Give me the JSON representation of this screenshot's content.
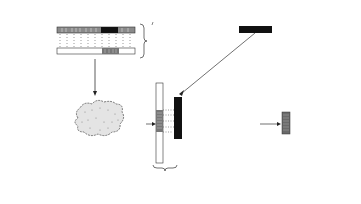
{
  "title_tumor": "Adenovirus type 12 tumor",
  "title_viral_dna": "Adenovirus type 12 DNA",
  "labels": {
    "dna": "DNA",
    "labeled_mrna": "Labeled\nmRNA",
    "with_isotope": "with\nisotope",
    "natural_hybrid": "natural\nhybrid",
    "isolated_labeled_mrna": "isolated\nlabeled\nmRNA",
    "cytoplasmic_ribosomes": "cytoplasmic\nribosomes",
    "plus_sign": "+",
    "rnase": "RNA ase",
    "synthetic_hybrid": "synthetic\nhybrid",
    "complementary_copy": "isolated complementary\ncopy of tumor DNA which\noriginates in viral DNA"
  },
  "colors": {
    "ink": "#222222",
    "dark_band": "#111111",
    "mid_band": "#6a6a6a",
    "light_band": "#9a9a9a"
  }
}
